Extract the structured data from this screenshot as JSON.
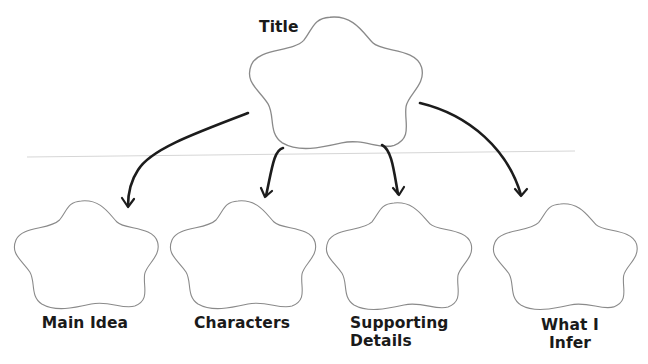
{
  "diagram": {
    "type": "graphic-organizer",
    "colors": {
      "background": "#ffffff",
      "cloud_stroke": "#8a8a8a",
      "arrow": "#1c1c1c",
      "rule_line": "#d6d6d6",
      "text": "#1a1a1a"
    },
    "root": {
      "label": "Title"
    },
    "children": [
      {
        "label_lines": [
          "Main Idea"
        ]
      },
      {
        "label_lines": [
          "Characters"
        ]
      },
      {
        "label_lines": [
          "Supporting",
          "Details"
        ]
      },
      {
        "label_lines": [
          "What I",
          "Infer"
        ]
      }
    ],
    "edges": [
      {
        "from": "Title",
        "to": "Main Idea"
      },
      {
        "from": "Title",
        "to": "Characters"
      },
      {
        "from": "Title",
        "to": "Supporting Details"
      },
      {
        "from": "Title",
        "to": "What I Infer"
      }
    ]
  }
}
